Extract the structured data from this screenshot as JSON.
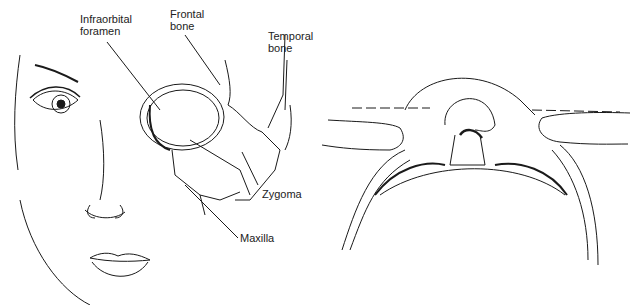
{
  "figure": {
    "left_panel": {
      "description": "Frontal view of face with orbital/zygomatic bone overlay",
      "labels": {
        "infraorbital_line1": "Infraorbital",
        "infraorbital_line2": "foramen",
        "frontal_line1": "Frontal",
        "frontal_line2": "bone",
        "temporal_line1": "Temporal",
        "temporal_line2": "bone",
        "zygoma": "Zygoma",
        "maxilla": "Maxilla"
      }
    },
    "right_panel": {
      "description": "Inferior (submental) view of head with thumbs pressing on zygomas, dashed reference line"
    },
    "colors": {
      "line": "#1a1a1a",
      "background": "#ffffff"
    }
  }
}
